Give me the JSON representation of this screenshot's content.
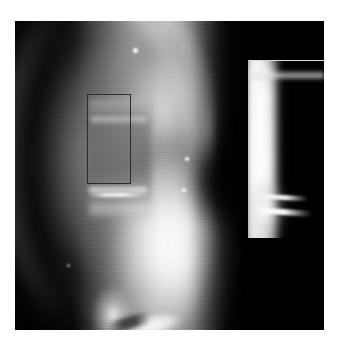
{
  "figure": {
    "kind": "radiograph-with-magnified-inset",
    "modality": "x-ray",
    "colorspace": "grayscale",
    "canvas": {
      "width": 338,
      "height": 343,
      "background": "#ffffff"
    },
    "image": {
      "x": 15,
      "y": 21,
      "width": 309,
      "height": 309,
      "background": "#010101"
    }
  },
  "roi": {
    "label": "",
    "x": 87,
    "y": 94,
    "width": 44,
    "height": 90,
    "stroke_color": "#2b2b2b",
    "stroke_width": 1.5,
    "style": "solid-rectangle"
  },
  "inset": {
    "label": "",
    "x": 248,
    "y": 60,
    "width": 76,
    "height": 177,
    "border_color": "#d9d9d9",
    "source": "roi",
    "placement": "top-right"
  },
  "features": {
    "bright_arc": "curved high-density cortical band at left",
    "dark_band": "low-density band between halo and cortex",
    "central_column": "vertebral column / mediastinal soft tissue",
    "right_dark_field": "dark background field right of column",
    "bottom_spur": "bright finger-like projection at lower center",
    "specks": [
      "speck-1",
      "speck-2",
      "speck-3",
      "speck-4"
    ],
    "fracture_lines": [
      "inset-fracture-a",
      "inset-fracture-b",
      "roi-fracture-line"
    ]
  },
  "palette": {
    "black": "#010101",
    "white": "#ffffff",
    "page": "#ffffff",
    "roi_stroke": "#2b2b2b",
    "inset_border": "#d9d9d9"
  }
}
